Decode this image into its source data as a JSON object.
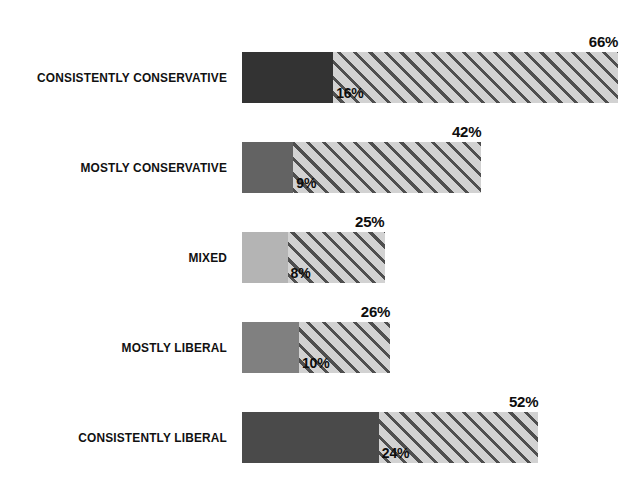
{
  "chart_data": {
    "type": "bar",
    "title": "",
    "subtitle": "",
    "xlabel": "",
    "ylabel": "",
    "orientation": "horizontal",
    "stacked": true,
    "grid": false,
    "legend_position": "none",
    "xlim": [
      0,
      70
    ],
    "categories": [
      "CONSISTENTLY CONSERVATIVE",
      "MOSTLY CONSERVATIVE",
      "MIXED",
      "MOSTLY LIBERAL",
      "CONSISTENTLY LIBERAL"
    ],
    "series": [
      {
        "name": "solid",
        "values": [
          16,
          9,
          8,
          10,
          24
        ],
        "labels": [
          "16%",
          "9%",
          "8%",
          "10%",
          "24%"
        ]
      },
      {
        "name": "total",
        "values": [
          66,
          42,
          25,
          26,
          52
        ],
        "labels": [
          "66%",
          "42%",
          "25%",
          "26%",
          "52%"
        ]
      }
    ],
    "bars": [
      {
        "category": "CONSISTENTLY CONSERVATIVE",
        "inner_value": 16,
        "inner_label": "16%",
        "total_value": 66,
        "total_label": "66%",
        "solid_color": "#333333",
        "hatch_color": "#d2d2d2"
      },
      {
        "category": "MOSTLY CONSERVATIVE",
        "inner_value": 9,
        "inner_label": "9%",
        "total_value": 42,
        "total_label": "42%",
        "solid_color": "#636363",
        "hatch_color": "#d2d2d2"
      },
      {
        "category": "MIXED",
        "inner_value": 8,
        "inner_label": "8%",
        "total_value": 25,
        "total_label": "25%",
        "solid_color": "#b4b4b4",
        "hatch_color": "#d2d2d2"
      },
      {
        "category": "MOSTLY LIBERAL",
        "inner_value": 10,
        "inner_label": "10%",
        "total_value": 26,
        "total_label": "26%",
        "solid_color": "#808080",
        "hatch_color": "#d2d2d2"
      },
      {
        "category": "CONSISTENTLY LIBERAL",
        "inner_value": 24,
        "inner_label": "24%",
        "total_value": 52,
        "total_label": "52%",
        "solid_color": "#4a4a4a",
        "hatch_color": "#d2d2d2"
      }
    ]
  },
  "layout": {
    "bar_origin_x": 242,
    "label_right_x": 227,
    "first_bar_top": 52,
    "row_pitch": 90,
    "bar_height": 51,
    "px_per_percent": 5.7
  }
}
